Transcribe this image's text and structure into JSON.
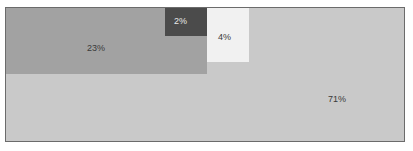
{
  "figure": {
    "top_clip_text": "",
    "background_color": "#ffffff",
    "border_color": "#6b6b6b"
  },
  "chart_data": {
    "type": "treemap",
    "title": "",
    "subtitle": "",
    "xlabel": "",
    "ylabel": "",
    "grid": false,
    "legend": "none",
    "categories": [
      "23%",
      "2%",
      "4%",
      "71%"
    ],
    "values": [
      23,
      2,
      4,
      71
    ],
    "value_unit": "percent",
    "total": 100,
    "series": [
      {
        "name": "share",
        "values": [
          23,
          2,
          4,
          71
        ]
      }
    ],
    "tiles": [
      {
        "label": "23%",
        "value": 23,
        "color": "#a2a2a2",
        "label_color": "#3a3a3a"
      },
      {
        "label": "2%",
        "value": 2,
        "color": "#4b4b4b",
        "label_color": "#e8e8e8"
      },
      {
        "label": "4%",
        "value": 4,
        "color": "#f1f1f1",
        "label_color": "#3a3a3a"
      },
      {
        "label": "71%",
        "value": 71,
        "color": "#c9c9c9",
        "label_color": "#3a3a3a"
      }
    ]
  }
}
